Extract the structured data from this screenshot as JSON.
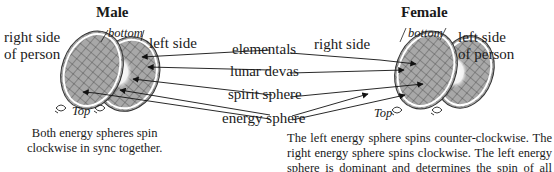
{
  "male": {
    "title": "Male",
    "right_side_line1": "right side",
    "right_side_line2": "of person",
    "left_side": "left side",
    "bottom": "bottom",
    "top": "Top",
    "caption_line1": "Both energy spheres spin",
    "caption_line2": "clockwise in sync together."
  },
  "female": {
    "title": "Female",
    "right_side": "right side",
    "left_side_line1": "left side",
    "left_side_line2": "of person",
    "bottom": "bottom",
    "top": "Top",
    "caption": "The left energy sphere spins counter-clockwise. The right energy sphere spins clockwise. The left energy sphere is dominant and determines the spin of all other centers in a female."
  },
  "center_labels": {
    "elementals": "elementals",
    "lunar_devas": "lunar devas",
    "spirit_sphere": "spirit sphere",
    "energy_sphere": "energy sphere"
  },
  "colors": {
    "sphere_fill": "#a8a8a8",
    "sphere_rim": "#ffffff",
    "grid_line": "#3a3a3a",
    "inner_glow": "#ffffff",
    "text": "#1a1a1a"
  }
}
